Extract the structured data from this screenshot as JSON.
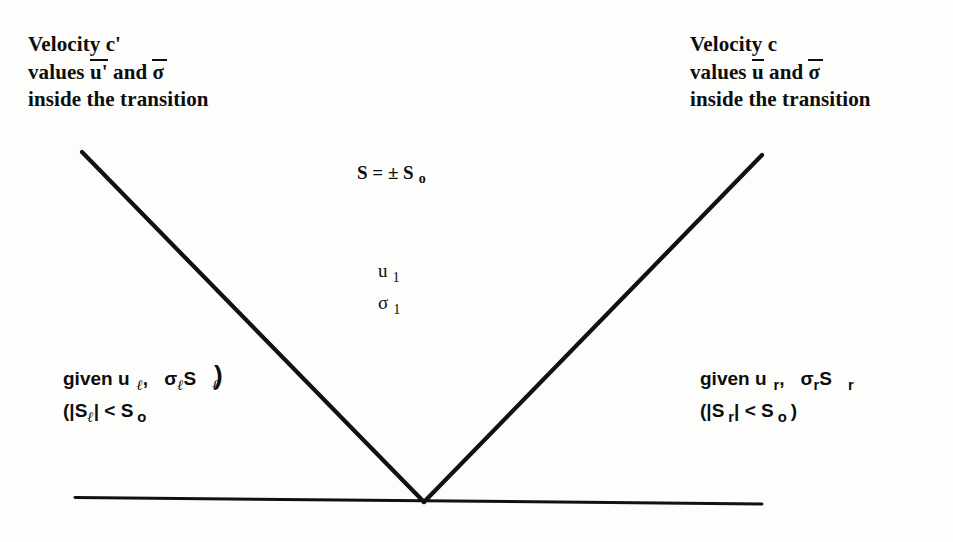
{
  "figure": {
    "type": "diagram"
  },
  "left_caption": {
    "line1": "Velocity c'",
    "line2_pre": "values ",
    "line2_u": "u'",
    "line2_mid": " and ",
    "line2_sigma": "σ",
    "line3": "inside the transition"
  },
  "right_caption": {
    "line1": "Velocity c",
    "line2_pre": "values ",
    "line2_u": "u",
    "line2_mid": " and ",
    "line2_sigma": "σ",
    "line3": "inside the transition"
  },
  "center_top": {
    "expr_main": "S = ± S",
    "expr_sub": "o"
  },
  "center_state": {
    "u_symbol": "u",
    "u_sub": "1",
    "sigma_symbol": "σ",
    "sigma_sub": "1"
  },
  "left_state": {
    "given_word": "given u",
    "given_sub": "ℓ",
    "comma": ",",
    "sigma": "σ",
    "sigma_sub": "ℓ",
    "s_symbol": "S",
    "s_sub": "ℓ",
    "cond_open": "(|S",
    "cond_sub": "ℓ",
    "cond_mid": "| < S",
    "cond_sub2": "o",
    "cond_close": ")"
  },
  "right_state": {
    "given_word": "given u",
    "given_sub": "r",
    "comma": ",",
    "sigma": "σ",
    "sigma_sub": "r",
    "s_symbol": "S",
    "s_sub": "r",
    "cond_open": "(|S",
    "cond_sub": "r",
    "cond_mid": "| < S",
    "cond_sub2": "o",
    "cond_close": ")"
  },
  "geometry": {
    "left_ray": {
      "x1": 82,
      "y1": 152,
      "x2": 424,
      "y2": 502
    },
    "right_ray": {
      "x1": 424,
      "y1": 502,
      "x2": 762,
      "y2": 155
    },
    "baseline": {
      "x1": 75,
      "y1": 497,
      "x2": 762,
      "y2": 504
    },
    "stroke_color": "#111111",
    "stroke_width": 4
  },
  "colors": {
    "background": "#fdfdfc",
    "ink": "#0d0d0d"
  }
}
